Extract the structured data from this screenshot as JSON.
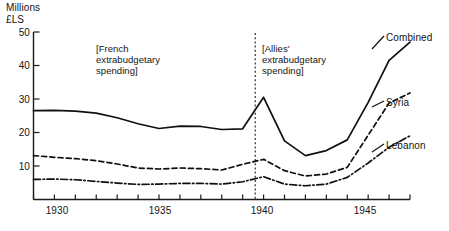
{
  "chart_data": {
    "type": "line",
    "title": "",
    "subtitle": "",
    "xlabel": "",
    "ylabel": "Millions\n£LS",
    "ylabel_lines": [
      "Millions",
      "£LS"
    ],
    "xlim": [
      1929,
      1947
    ],
    "ylim": [
      0,
      50
    ],
    "yticks": [
      0,
      10,
      20,
      30,
      40,
      50
    ],
    "ytick_labels": [
      "0",
      "10",
      "20",
      "30",
      "40",
      "50"
    ],
    "ytick_labels_shown": [
      "10",
      "20",
      "30",
      "40",
      "50"
    ],
    "xticks": [
      1929,
      1930,
      1931,
      1932,
      1933,
      1934,
      1935,
      1936,
      1937,
      1938,
      1939,
      1940,
      1941,
      1942,
      1943,
      1944,
      1945,
      1946,
      1947
    ],
    "xtick_labels_shown": [
      "1930",
      "1935",
      "1940",
      "1945"
    ],
    "grid": false,
    "legend_position": "right-inline-labels",
    "x": [
      1929,
      1930,
      1931,
      1932,
      1933,
      1934,
      1935,
      1936,
      1937,
      1938,
      1939,
      1940,
      1941,
      1942,
      1943,
      1944,
      1945,
      1946,
      1947
    ],
    "series": [
      {
        "name": "Combined",
        "linestyle": "solid",
        "color": "#101010",
        "values": [
          26.5,
          26.6,
          26.4,
          25.8,
          24.4,
          22.6,
          21.2,
          21.9,
          21.8,
          20.9,
          21.1,
          30.5,
          17.5,
          13.1,
          14.6,
          17.8,
          29.0,
          41.5,
          47.0
        ]
      },
      {
        "name": "Syria",
        "linestyle": "dashed",
        "color": "#101010",
        "values": [
          13.1,
          12.6,
          12.2,
          11.6,
          10.6,
          9.4,
          9.1,
          9.4,
          9.2,
          8.8,
          10.5,
          12.0,
          8.6,
          7.0,
          7.6,
          9.6,
          19.2,
          28.8,
          31.8
        ]
      },
      {
        "name": "Lebanon",
        "linestyle": "dashdot",
        "color": "#101010",
        "values": [
          6.0,
          6.1,
          5.9,
          5.4,
          4.9,
          4.5,
          4.6,
          4.8,
          4.8,
          4.6,
          5.3,
          6.8,
          4.6,
          4.1,
          4.6,
          6.6,
          10.9,
          15.6,
          19.0
        ]
      }
    ],
    "annotations": [
      {
        "id": "french-spending",
        "text": "[French\nextrabudgetary\nspending]",
        "lines": [
          "[French",
          "extrabudgetary",
          "spending]"
        ],
        "x_range": [
          1929,
          1939.6
        ]
      },
      {
        "id": "allies-spending",
        "text": "[Allies'\nextrabudgetary\nspending]",
        "lines": [
          "[Allies'",
          "extrabudgetary",
          "spending]"
        ],
        "x_range": [
          1939.6,
          1947
        ]
      }
    ],
    "divider": {
      "id": "period-divider",
      "x": 1939.6,
      "linestyle": "dotted"
    }
  },
  "labels": {
    "axis_unit": "Millions\n£LS",
    "y_0": "0",
    "y_10": "10",
    "y_20": "20",
    "y_30": "30",
    "y_40": "40",
    "y_50": "50",
    "x_1930": "1930",
    "x_1935": "1935",
    "x_1940": "1940",
    "x_1945": "1945",
    "annot_french": "[French\nextrabudgetary\nspending]",
    "annot_allies": "[Allies'\nextrabudgetary\nspending]",
    "series_combined": "Combined",
    "series_syria": "Syria",
    "series_lebanon": "Lebanon"
  },
  "colors": {
    "ink": "#101010",
    "background": "#ffffff",
    "axis": "#1a1a1a"
  }
}
